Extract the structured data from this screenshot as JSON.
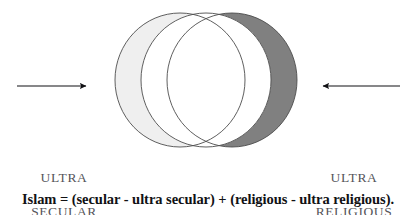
{
  "figure": {
    "name": "islam-secular-religious-venn",
    "background_color": "#ffffff"
  },
  "diagram": {
    "type": "venn-three-overlapping-circles",
    "circles": [
      {
        "name": "ultra-secular-circle",
        "label": "ultra secular",
        "fill": "#efefef",
        "stroke": "#4d4d4d",
        "cx": 180,
        "cy": 80,
        "rx": 65,
        "ry": 67
      },
      {
        "name": "islam-center-circle",
        "label": "Islam",
        "fill": "#ffffff",
        "stroke": "#4d4d4d",
        "cx": 206,
        "cy": 80,
        "rx": 65,
        "ry": 67
      },
      {
        "name": "ultra-religious-circle",
        "label": "ultra religious",
        "fill": "#808080",
        "stroke": "#4d4d4d",
        "cx": 232,
        "cy": 80,
        "rx": 65,
        "ry": 67
      }
    ],
    "arrows": [
      {
        "name": "left-arrow",
        "direction": "right",
        "x_start": 17,
        "x_end": 88,
        "y": 86,
        "color": "#111114"
      },
      {
        "name": "right-arrow",
        "direction": "left",
        "x_start": 400,
        "x_end": 321,
        "y": 86,
        "color": "#111114"
      }
    ]
  },
  "labels": {
    "left": {
      "line1": "ULTRA",
      "line2": "SECULAR",
      "color": "#55555a"
    },
    "right": {
      "line1": "ULTRA",
      "line2": "RELIGIOUS",
      "color": "#55555a"
    }
  },
  "caption": {
    "text": "Islam = (secular - ultra secular) + (religious - ultra religious).",
    "color": "#111114"
  }
}
